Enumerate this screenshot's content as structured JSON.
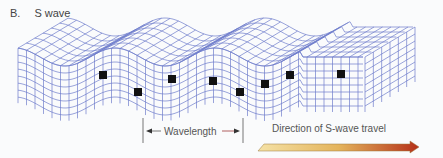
{
  "figure": {
    "letter": "B.",
    "title": "S wave"
  },
  "labels": {
    "wavelength": "Wavelength",
    "direction": "Direction of S-wave travel"
  },
  "colors": {
    "grid": "#6a78c8",
    "marker": "#111111",
    "arrow_start": "#f3dc9a",
    "arrow_mid": "#e2b05a",
    "arrow_end": "#b8351c",
    "text": "#555555"
  },
  "markers": [
    {
      "x": 103,
      "y": 75
    },
    {
      "x": 138,
      "y": 92
    },
    {
      "x": 172,
      "y": 79
    },
    {
      "x": 213,
      "y": 81
    },
    {
      "x": 240,
      "y": 92
    },
    {
      "x": 265,
      "y": 84
    },
    {
      "x": 290,
      "y": 75
    },
    {
      "x": 341,
      "y": 74
    }
  ]
}
